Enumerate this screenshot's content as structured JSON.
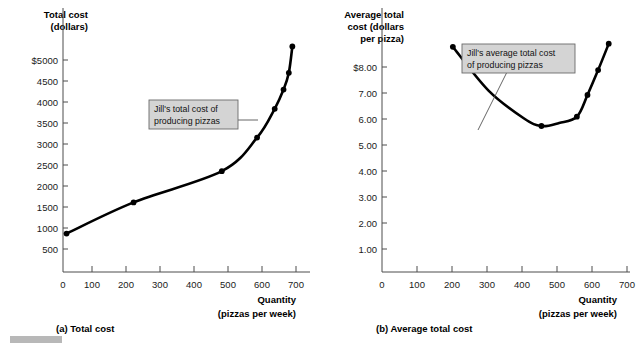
{
  "figure": {
    "background_color": "#ffffff",
    "curve_color": "#000000",
    "callout_fill": "#d4d4d4",
    "callout_border": "#6b6b6b",
    "axis_color": "#4d4d4d"
  },
  "panels": [
    {
      "id": "total-cost",
      "caption": "(a) Total cost",
      "y_axis_title_lines": [
        "Total cost",
        "(dollars)"
      ],
      "x_axis_title_lines": [
        "Quantity",
        "(pizzas per week)"
      ],
      "callout": {
        "lines": [
          "Jill's total cost of",
          "producing pizzas"
        ]
      },
      "chart_data": {
        "type": "line",
        "title": "(a) Total cost",
        "xlabel": "Quantity (pizzas per week)",
        "ylabel": "Total cost (dollars)",
        "xlim": [
          0,
          700
        ],
        "ylim": [
          0,
          5500
        ],
        "xticks": [
          0,
          100,
          200,
          300,
          400,
          500,
          600,
          700
        ],
        "xtick_labels": [
          "0",
          "100",
          "200",
          "300",
          "400",
          "500",
          "600",
          "700"
        ],
        "yticks": [
          500,
          1000,
          1500,
          2000,
          2500,
          3000,
          3500,
          4000,
          4500,
          5000
        ],
        "ytick_labels": [
          "500",
          "1000",
          "1500",
          "2000",
          "2500",
          "3000",
          "3500",
          "4000",
          "4500",
          "$5000"
        ],
        "grid": false,
        "legend": "none",
        "series": [
          {
            "name": "Jill's total cost of producing pizzas",
            "x": [
              10,
              200,
              450,
              550,
              600,
              625,
              640,
              650
            ],
            "y": [
              800,
              1450,
              2100,
              2800,
              3400,
              3800,
              4150,
              4700
            ]
          }
        ],
        "markers": [
          {
            "x": 10,
            "y": 800
          },
          {
            "x": 200,
            "y": 1450
          },
          {
            "x": 450,
            "y": 2100
          },
          {
            "x": 550,
            "y": 2800
          },
          {
            "x": 600,
            "y": 3400
          },
          {
            "x": 625,
            "y": 3800
          },
          {
            "x": 640,
            "y": 4150
          },
          {
            "x": 650,
            "y": 4700
          }
        ]
      }
    },
    {
      "id": "average-total-cost",
      "caption": "(b) Average total cost",
      "y_axis_title_lines": [
        "Average total",
        "cost (dollars",
        "per pizza)"
      ],
      "x_axis_title_lines": [
        "Quantity",
        "(pizzas per week)"
      ],
      "callout": {
        "lines": [
          "Jill's average total cost",
          "of producing pizzas"
        ]
      },
      "chart_data": {
        "type": "line",
        "title": "(b) Average total cost",
        "xlabel": "Quantity (pizzas per week)",
        "ylabel": "Average total cost (dollars per pizza)",
        "xlim": [
          0,
          700
        ],
        "ylim": [
          0,
          8.5
        ],
        "xticks": [
          0,
          100,
          200,
          300,
          400,
          500,
          600,
          700
        ],
        "xtick_labels": [
          "0",
          "100",
          "200",
          "300",
          "400",
          "500",
          "600",
          "700"
        ],
        "yticks": [
          1.0,
          2.0,
          3.0,
          4.0,
          5.0,
          6.0,
          7.0,
          8.0
        ],
        "ytick_labels": [
          "1.00",
          "2.00",
          "3.00",
          "4.00",
          "5.00",
          "6.00",
          "7.00",
          "$8.00"
        ],
        "grid": false,
        "legend": "none",
        "series": [
          {
            "name": "Jill's average total cost of producing pizzas",
            "x": [
              200,
              300,
              400,
              450,
              500,
              550,
              580,
              610,
              640
            ],
            "y": [
              7.25,
              5.85,
              4.95,
              4.7,
              4.8,
              5.0,
              5.7,
              6.5,
              7.35
            ]
          }
        ],
        "markers": [
          {
            "x": 200,
            "y": 7.25
          },
          {
            "x": 450,
            "y": 4.7
          },
          {
            "x": 550,
            "y": 5.0
          },
          {
            "x": 580,
            "y": 5.7
          },
          {
            "x": 610,
            "y": 6.5
          },
          {
            "x": 640,
            "y": 7.35
          }
        ]
      }
    }
  ]
}
